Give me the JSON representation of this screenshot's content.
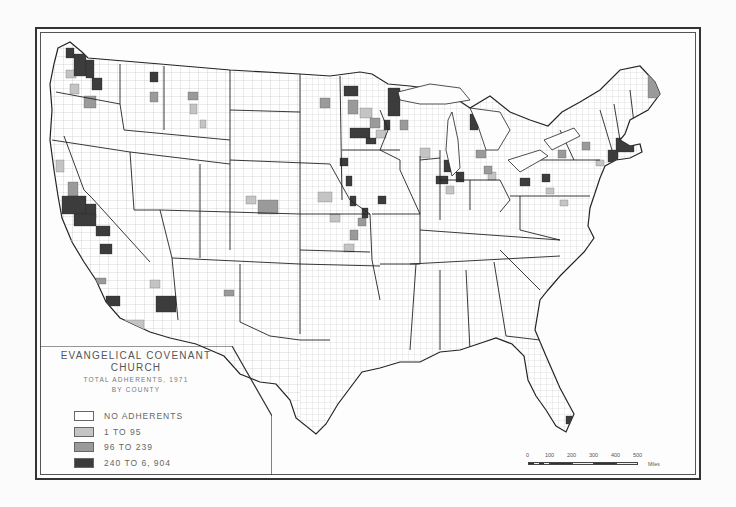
{
  "map": {
    "title_line1": "EVANGELICAL COVENANT",
    "title_line2": "CHURCH",
    "subtitle_line1": "TOTAL ADHERENTS, 1971",
    "subtitle_line2": "BY COUNTY",
    "region": "Contiguous United States",
    "colors": {
      "none": "#ffffff",
      "low": "#c4c4c4",
      "mid": "#9a9a9a",
      "high": "#3c3c3c",
      "border": "#333333"
    }
  },
  "legend": {
    "items": [
      {
        "label": "NO ADHERENTS",
        "color": "#ffffff"
      },
      {
        "label": "1 TO 95",
        "color": "#c4c4c4"
      },
      {
        "label": "96 TO 239",
        "color": "#9a9a9a"
      },
      {
        "label": "240 TO 6, 904",
        "color": "#3c3c3c"
      }
    ]
  },
  "scale": {
    "ticks": [
      "0",
      "100",
      "200",
      "300",
      "400",
      "500"
    ],
    "unit": "Miles"
  },
  "highlights": [
    {
      "area": "Puget Sound, Washington",
      "class": "240 TO 6, 904"
    },
    {
      "area": "San Francisco Bay, California",
      "class": "240 TO 6, 904"
    },
    {
      "area": "Los Angeles, California",
      "class": "240 TO 6, 904"
    },
    {
      "area": "Phoenix, Arizona",
      "class": "240 TO 6, 904"
    },
    {
      "area": "Minneapolis-St. Paul, Minnesota",
      "class": "240 TO 6, 904"
    },
    {
      "area": "Northeast Minnesota",
      "class": "240 TO 6, 904"
    },
    {
      "area": "Chicago, Illinois",
      "class": "240 TO 6, 904"
    },
    {
      "area": "Boston / Worcester, Massachusetts",
      "class": "240 TO 6, 904"
    },
    {
      "area": "Jamestown, New York",
      "class": "240 TO 6, 904"
    },
    {
      "area": "Northern Maine",
      "class": "96 TO 239"
    },
    {
      "area": "South Florida",
      "class": "240 TO 6, 904"
    }
  ]
}
